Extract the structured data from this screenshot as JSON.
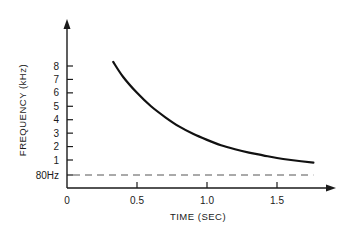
{
  "chart_data": {
    "type": "line",
    "title": "",
    "xlabel": "TIME (SEC)",
    "ylabel": "FREQUENCY (kHz)",
    "x_ticks": [
      "0",
      "0.5",
      "1.0",
      "1.5"
    ],
    "x_tick_values": [
      0,
      0.5,
      1.0,
      1.5
    ],
    "y_ticks": [
      "80Hz",
      "1",
      "2",
      "3",
      "4",
      "5",
      "6",
      "7",
      "8"
    ],
    "y_tick_values": [
      0.08,
      1,
      2,
      3,
      4,
      5,
      6,
      7,
      8
    ],
    "xlim": [
      0,
      1.85
    ],
    "ylim": [
      -0.9,
      9.5
    ],
    "grid": false,
    "legend": null,
    "series": [
      {
        "name": "frequency sweep",
        "style": "solid",
        "x": [
          0.33,
          0.4,
          0.5,
          0.6,
          0.7,
          0.8,
          0.9,
          1.0,
          1.1,
          1.2,
          1.3,
          1.4,
          1.5,
          1.6,
          1.76
        ],
        "y": [
          8.3,
          7.2,
          6.0,
          5.0,
          4.2,
          3.5,
          2.95,
          2.5,
          2.1,
          1.8,
          1.55,
          1.35,
          1.15,
          1.0,
          0.8
        ]
      },
      {
        "name": "80 Hz reference",
        "style": "dashed",
        "x": [
          0,
          1.76
        ],
        "y": [
          0.08,
          0.08
        ]
      }
    ]
  }
}
